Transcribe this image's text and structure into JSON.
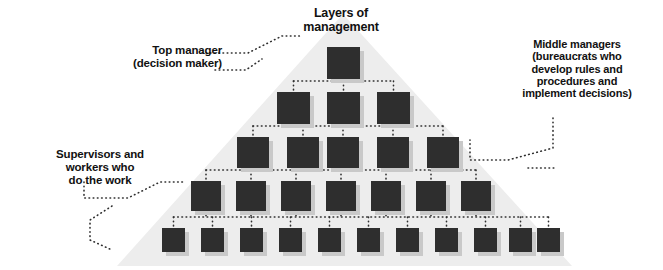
{
  "diagram": {
    "type": "organizational-pyramid",
    "title": "Layers of\nmanagement",
    "background_color": "#ffffff",
    "pyramid_fill": "#ededed",
    "node_color": "#2e2e2e",
    "shadow_color": "#c9c9c9",
    "connector_color": "#2e2e2e",
    "pyramid": {
      "apex_x": 343,
      "apex_y": 14,
      "base_left_x": 117,
      "base_right_x": 572,
      "base_y": 266
    },
    "labels": {
      "title": "Layers of\nmanagement",
      "top_manager": "Top manager\n(decision maker)",
      "middle_managers": "Middle managers\n(bureaucrats who\ndevelop rules and\nprocedures and\nimplement decisions)",
      "supervisors": "Supervisors and\nworkers who\ndo the work"
    },
    "levels": [
      {
        "name": "top-manager",
        "count": 1,
        "box_w": 33,
        "box_h": 32,
        "y": 47,
        "xs": [
          327
        ]
      },
      {
        "name": "middle-managers-upper",
        "count": 3,
        "box_w": 33,
        "box_h": 32,
        "y": 92,
        "xs": [
          277,
          327,
          377
        ]
      },
      {
        "name": "middle-managers-lower",
        "count": 5,
        "box_w": 32,
        "box_h": 31,
        "y": 137,
        "xs": [
          237,
          287,
          327,
          377,
          427
        ]
      },
      {
        "name": "supervisors",
        "count": 7,
        "box_w": 30,
        "box_h": 30,
        "y": 181,
        "xs": [
          191,
          236,
          281,
          326,
          371,
          416,
          461
        ]
      },
      {
        "name": "workers",
        "count": 11,
        "box_w": 23,
        "box_h": 24,
        "y": 228,
        "xs": [
          162,
          201,
          240,
          279,
          318,
          357,
          396,
          435,
          474,
          509,
          537
        ]
      }
    ]
  }
}
